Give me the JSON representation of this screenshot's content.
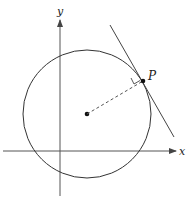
{
  "diagram": {
    "axes": {
      "x_label": "x",
      "y_label": "y"
    },
    "circle": {
      "center_marker": "center-point"
    },
    "point": {
      "label": "P"
    },
    "annotations": {
      "radius_style": "dashed",
      "tangent_line": "tangent at P",
      "right_angle": "radius perpendicular to tangent"
    },
    "colors": {
      "stroke": "#333333",
      "background": "#ffffff"
    }
  }
}
